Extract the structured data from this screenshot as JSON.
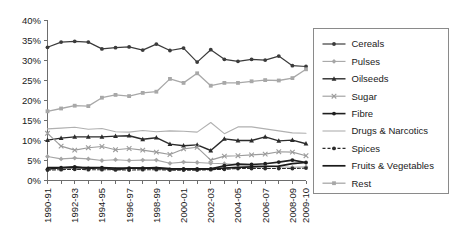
{
  "chart_data": {
    "type": "line",
    "title": "",
    "xlabel": "",
    "ylabel": "",
    "ylim": [
      0,
      40
    ],
    "ytick_step": 5,
    "ytick_labels": [
      "0%",
      "5%",
      "10%",
      "15%",
      "20%",
      "25%",
      "30%",
      "35%",
      "40%"
    ],
    "grid": false,
    "legend_position": "right",
    "categories": [
      "1990-91",
      "1991-92",
      "1992-93",
      "1993-94",
      "1994-95",
      "1995-96",
      "1996-97",
      "1997-98",
      "1998-99",
      "1999-00",
      "2000-01",
      "2001-02",
      "2002-03",
      "2003-04",
      "2004-05",
      "2005-06",
      "2006-07",
      "2007-08",
      "2008-09",
      "2009-10"
    ],
    "xtick_labels_visible": [
      "1990-91",
      "",
      "1992-93",
      "",
      "1994-95",
      "",
      "1996-97",
      "",
      "1998-99",
      "",
      "2000-01",
      "",
      "2002-03",
      "",
      "2004-05",
      "",
      "2006-07",
      "",
      "2008-09",
      "2009-10"
    ],
    "series": [
      {
        "name": "Cereals",
        "color": "#3b3b3b",
        "marker": "circle",
        "dash": "none",
        "width": 1.2,
        "values": [
          33.3,
          34.6,
          34.8,
          34.6,
          32.9,
          33.2,
          33.4,
          32.6,
          34.1,
          32.5,
          33.1,
          29.6,
          32.7,
          30.3,
          29.8,
          30.3,
          30.1,
          31.1,
          28.7,
          28.5
        ]
      },
      {
        "name": "Pulses",
        "color": "#a6a6a6",
        "marker": "diamond",
        "dash": "none",
        "width": 1.1,
        "values": [
          6.0,
          5.4,
          5.6,
          5.4,
          5.0,
          5.2,
          5.0,
          5.1,
          5.1,
          4.3,
          4.6,
          4.5,
          4.3,
          4.2,
          4.0,
          3.8,
          3.7,
          3.4,
          3.3,
          3.4
        ]
      },
      {
        "name": "Oilseeds",
        "color": "#2b2b2b",
        "marker": "triangle",
        "dash": "none",
        "width": 1.4,
        "values": [
          10.1,
          10.6,
          10.9,
          10.9,
          10.9,
          11.1,
          11.2,
          10.3,
          10.7,
          9.1,
          8.7,
          8.9,
          7.5,
          10.4,
          10.0,
          10.0,
          10.9,
          9.9,
          10.1,
          9.2
        ]
      },
      {
        "name": "Sugar",
        "color": "#9c9c9c",
        "marker": "cross",
        "dash": "none",
        "width": 1.1,
        "values": [
          11.8,
          8.6,
          7.6,
          8.2,
          8.5,
          7.7,
          8.0,
          7.6,
          7.1,
          6.5,
          7.9,
          8.3,
          5.1,
          6.1,
          6.2,
          6.4,
          6.6,
          7.2,
          7.1,
          6.2
        ]
      },
      {
        "name": "Fibre",
        "color": "#1f1f1f",
        "marker": "circle",
        "dash": "none",
        "width": 1.6,
        "values": [
          2.8,
          3.2,
          3.4,
          3.0,
          3.2,
          2.7,
          3.1,
          3.1,
          3.0,
          2.8,
          2.9,
          2.9,
          2.9,
          3.7,
          4.1,
          4.0,
          4.2,
          4.6,
          5.1,
          4.5
        ]
      },
      {
        "name": "Drugs & Narcotics",
        "color": "#b0b0b0",
        "marker": "none",
        "dash": "none",
        "width": 1.1,
        "values": [
          12.9,
          13.1,
          13.3,
          12.8,
          13.0,
          12.2,
          12.1,
          12.5,
          12.2,
          12.4,
          12.3,
          12.1,
          14.5,
          11.7,
          13.4,
          13.4,
          12.9,
          12.4,
          11.9,
          11.8
        ]
      },
      {
        "name": "Spices",
        "color": "#2b2b2b",
        "marker": "circle",
        "dash": "dashed",
        "width": 1.1,
        "values": [
          2.6,
          2.7,
          2.8,
          2.7,
          2.7,
          2.7,
          2.6,
          2.7,
          2.7,
          2.6,
          2.6,
          2.6,
          2.7,
          2.8,
          3.0,
          3.0,
          3.0,
          3.0,
          3.0,
          3.1
        ]
      },
      {
        "name": "Fruits & Vegetables",
        "color": "#1a1a1a",
        "marker": "none",
        "dash": "none",
        "width": 1.7,
        "values": [
          3.2,
          3.2,
          3.3,
          3.2,
          3.2,
          3.1,
          3.1,
          3.1,
          3.2,
          3.0,
          2.9,
          2.9,
          2.9,
          3.1,
          3.3,
          3.4,
          3.5,
          3.6,
          4.2,
          4.5
        ]
      },
      {
        "name": "Rest",
        "color": "#a8a8a8",
        "marker": "square",
        "dash": "none",
        "width": 1.3,
        "values": [
          17.3,
          18.0,
          18.7,
          18.6,
          20.7,
          21.4,
          21.1,
          21.9,
          22.2,
          25.4,
          24.4,
          26.8,
          23.7,
          24.4,
          24.4,
          24.8,
          25.1,
          25.0,
          25.6,
          27.8
        ]
      }
    ]
  },
  "legend": {
    "items": [
      {
        "label": "Cereals"
      },
      {
        "label": "Pulses"
      },
      {
        "label": "Oilseeds"
      },
      {
        "label": "Sugar"
      },
      {
        "label": "Fibre"
      },
      {
        "label": "Drugs & Narcotics"
      },
      {
        "label": "Spices"
      },
      {
        "label": "Fruits & Vegetables"
      },
      {
        "label": "Rest"
      }
    ]
  }
}
